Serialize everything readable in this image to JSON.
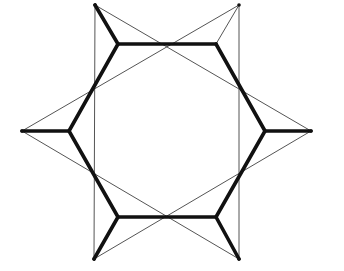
{
  "diagram": {
    "type": "six-pointed-star-construction",
    "size": [
      344,
      271
    ],
    "colors": {
      "background": "#ffffff",
      "thin_line": "#555555",
      "thick_line": "#111111"
    },
    "outer_tips": {
      "top_left": [
        95,
        5
      ],
      "top_right": [
        239,
        5
      ],
      "left": [
        22,
        131
      ],
      "right": [
        311,
        131
      ],
      "bottom_left": [
        94,
        259
      ],
      "bottom_right": [
        239,
        259
      ]
    },
    "inner_hexagon": {
      "top_left": [
        118,
        44
      ],
      "top_right": [
        216,
        44
      ],
      "right": [
        265,
        131
      ],
      "bottom_right": [
        216,
        217
      ],
      "bottom_left": [
        118,
        217
      ],
      "left": [
        69,
        131
      ]
    },
    "thin_lines": [
      [
        [
          95,
          5
        ],
        [
          94,
          259
        ]
      ],
      [
        [
          239,
          5
        ],
        [
          239,
          259
        ]
      ],
      [
        [
          95,
          5
        ],
        [
          311,
          131
        ]
      ],
      [
        [
          94,
          259
        ],
        [
          311,
          131
        ]
      ],
      [
        [
          239,
          5
        ],
        [
          22,
          131
        ]
      ],
      [
        [
          239,
          259
        ],
        [
          22,
          131
        ]
      ],
      [
        [
          239,
          5
        ],
        [
          216,
          44
        ]
      ]
    ],
    "thick_lines": [
      [
        [
          118,
          44
        ],
        [
          216,
          44
        ]
      ],
      [
        [
          216,
          44
        ],
        [
          265,
          131
        ]
      ],
      [
        [
          265,
          131
        ],
        [
          216,
          217
        ]
      ],
      [
        [
          216,
          217
        ],
        [
          118,
          217
        ]
      ],
      [
        [
          118,
          217
        ],
        [
          69,
          131
        ]
      ],
      [
        [
          69,
          131
        ],
        [
          118,
          44
        ]
      ],
      [
        [
          118,
          44
        ],
        [
          95,
          5
        ]
      ],
      [
        [
          69,
          131
        ],
        [
          22,
          131
        ]
      ],
      [
        [
          118,
          217
        ],
        [
          94,
          259
        ]
      ],
      [
        [
          216,
          217
        ],
        [
          239,
          259
        ]
      ],
      [
        [
          265,
          131
        ],
        [
          311,
          131
        ]
      ]
    ]
  }
}
